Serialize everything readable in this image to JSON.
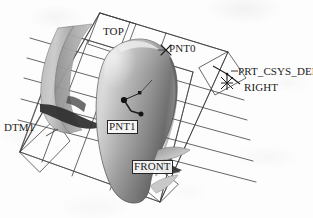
{
  "view": {
    "title": "3D CAD model viewport",
    "background_color": "#fdfdfd",
    "line_color": "#3a3a3a",
    "surface_light": "#e2e2e2",
    "surface_mid": "#a8a8a8",
    "surface_dark": "#6a6a6a",
    "surface_shadow": "#3c3c3c"
  },
  "labels": {
    "top_plane": "TOP",
    "front_plane": "FRONT",
    "right_plane": "RIGHT",
    "dtm1_plane": "DTM1",
    "point0": "PNT0",
    "point1": "PNT1",
    "csys": "PRT_CSYS_DEF"
  },
  "entities": [
    {
      "name": "TOP",
      "kind": "datum-plane",
      "boxed": true
    },
    {
      "name": "FRONT",
      "kind": "datum-plane",
      "boxed": true
    },
    {
      "name": "RIGHT",
      "kind": "datum-plane",
      "boxed": false
    },
    {
      "name": "DTM1",
      "kind": "datum-plane",
      "boxed": false
    },
    {
      "name": "PNT0",
      "kind": "datum-point",
      "boxed": false
    },
    {
      "name": "PNT1",
      "kind": "datum-point",
      "boxed": true
    },
    {
      "name": "PRT_CSYS_DEF",
      "kind": "coordinate-system",
      "boxed": false
    }
  ]
}
